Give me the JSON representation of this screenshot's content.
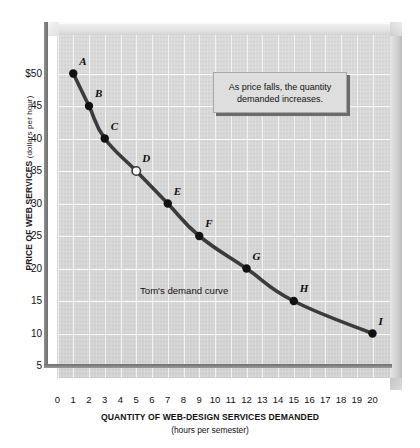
{
  "chart_data": {
    "type": "line",
    "title": "",
    "xlabel": "QUANTITY OF WEB-DESIGN SERVICES DEMANDED",
    "xlabel_sub": "(hours per semester)",
    "ylabel": "PRICE OF WEB SERVICES",
    "ylabel_sub": "(dollars per hour)",
    "xlim": [
      0,
      20
    ],
    "ylim": [
      0,
      52
    ],
    "grid": true,
    "legend": "none",
    "series_name": "Tom's demand curve",
    "x": [
      1,
      2,
      3,
      5,
      7,
      9,
      12,
      15,
      20
    ],
    "values": [
      50,
      45,
      40,
      35,
      30,
      25,
      20,
      15,
      10
    ],
    "point_labels": [
      "A",
      "B",
      "C",
      "D",
      "E",
      "F",
      "G",
      "H",
      "I"
    ],
    "points": [
      {
        "label": "A",
        "x": 1,
        "y": 50,
        "marker": "filled"
      },
      {
        "label": "B",
        "x": 2,
        "y": 45,
        "marker": "filled"
      },
      {
        "label": "C",
        "x": 3,
        "y": 40,
        "marker": "filled"
      },
      {
        "label": "D",
        "x": 5,
        "y": 35,
        "marker": "hollow"
      },
      {
        "label": "E",
        "x": 7,
        "y": 30,
        "marker": "filled"
      },
      {
        "label": "F",
        "x": 9,
        "y": 25,
        "marker": "filled"
      },
      {
        "label": "G",
        "x": 12,
        "y": 20,
        "marker": "filled"
      },
      {
        "label": "H",
        "x": 15,
        "y": 15,
        "marker": "filled"
      },
      {
        "label": "I",
        "x": 20,
        "y": 10,
        "marker": "filled"
      }
    ],
    "xticks": [
      "0",
      "1",
      "2",
      "3",
      "4",
      "5",
      "6",
      "7",
      "8",
      "9",
      "10",
      "11",
      "12",
      "13",
      "14",
      "15",
      "16",
      "17",
      "18",
      "19",
      "20"
    ],
    "yticks": [
      "$50",
      "45",
      "40",
      "35",
      "30",
      "25",
      "20",
      "15",
      "10",
      "5"
    ],
    "ytick_values": [
      50,
      45,
      40,
      35,
      30,
      25,
      20,
      15,
      10,
      5
    ],
    "annotation": "As price falls, the quantity demanded increases.",
    "colors": {
      "curve": "#3b3b3b",
      "panel_background": "#d6d6d6",
      "gridline": "#f6f6f6",
      "axis": "#777777",
      "marker_fill": "#111111",
      "marker_hollow": "#ffffff",
      "callout_background": "#dedede",
      "text": "#111111"
    }
  }
}
